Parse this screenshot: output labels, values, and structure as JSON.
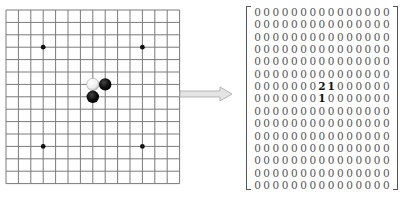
{
  "board": {
    "size": 15,
    "origin": {
      "x": 6,
      "y": 10
    },
    "spacing": 12.4,
    "line_color": "#7a7a7a",
    "star_points": [
      [
        3,
        3
      ],
      [
        11,
        3
      ],
      [
        3,
        11
      ],
      [
        11,
        11
      ]
    ],
    "stones": [
      {
        "col": 7,
        "row": 6,
        "color": "white"
      },
      {
        "col": 8,
        "row": 6,
        "color": "black"
      },
      {
        "col": 7,
        "row": 7,
        "color": "black"
      }
    ]
  },
  "arrow": {
    "direction": "right",
    "color": "#c8c8c8"
  },
  "matrix": {
    "rows": 15,
    "cols": 15,
    "legend": {
      "0": "empty",
      "1": "black",
      "2": "white"
    },
    "values": [
      [
        0,
        0,
        0,
        0,
        0,
        0,
        0,
        0,
        0,
        0,
        0,
        0,
        0,
        0,
        0
      ],
      [
        0,
        0,
        0,
        0,
        0,
        0,
        0,
        0,
        0,
        0,
        0,
        0,
        0,
        0,
        0
      ],
      [
        0,
        0,
        0,
        0,
        0,
        0,
        0,
        0,
        0,
        0,
        0,
        0,
        0,
        0,
        0
      ],
      [
        0,
        0,
        0,
        0,
        0,
        0,
        0,
        0,
        0,
        0,
        0,
        0,
        0,
        0,
        0
      ],
      [
        0,
        0,
        0,
        0,
        0,
        0,
        0,
        0,
        0,
        0,
        0,
        0,
        0,
        0,
        0
      ],
      [
        0,
        0,
        0,
        0,
        0,
        0,
        0,
        0,
        0,
        0,
        0,
        0,
        0,
        0,
        0
      ],
      [
        0,
        0,
        0,
        0,
        0,
        0,
        0,
        2,
        1,
        0,
        0,
        0,
        0,
        0,
        0
      ],
      [
        0,
        0,
        0,
        0,
        0,
        0,
        0,
        1,
        0,
        0,
        0,
        0,
        0,
        0,
        0
      ],
      [
        0,
        0,
        0,
        0,
        0,
        0,
        0,
        0,
        0,
        0,
        0,
        0,
        0,
        0,
        0
      ],
      [
        0,
        0,
        0,
        0,
        0,
        0,
        0,
        0,
        0,
        0,
        0,
        0,
        0,
        0,
        0
      ],
      [
        0,
        0,
        0,
        0,
        0,
        0,
        0,
        0,
        0,
        0,
        0,
        0,
        0,
        0,
        0
      ],
      [
        0,
        0,
        0,
        0,
        0,
        0,
        0,
        0,
        0,
        0,
        0,
        0,
        0,
        0,
        0
      ],
      [
        0,
        0,
        0,
        0,
        0,
        0,
        0,
        0,
        0,
        0,
        0,
        0,
        0,
        0,
        0
      ],
      [
        0,
        0,
        0,
        0,
        0,
        0,
        0,
        0,
        0,
        0,
        0,
        0,
        0,
        0,
        0
      ],
      [
        0,
        0,
        0,
        0,
        0,
        0,
        0,
        0,
        0,
        0,
        0,
        0,
        0,
        0,
        0
      ]
    ]
  }
}
